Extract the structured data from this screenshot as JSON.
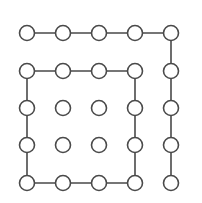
{
  "diagram": {
    "type": "node-grid",
    "background": "#ffffff",
    "stroke_color": "#4a4a4a",
    "node_fill": "#ffffff",
    "node_radius": 7.5,
    "stroke_width": 1.6,
    "columns_x": [
      27,
      63,
      99,
      135,
      171
    ],
    "rows_y": [
      33,
      71,
      108,
      145,
      183
    ],
    "nodes": [
      {
        "id": "r1c1",
        "row": 0,
        "col": 0
      },
      {
        "id": "r1c2",
        "row": 0,
        "col": 1
      },
      {
        "id": "r1c3",
        "row": 0,
        "col": 2
      },
      {
        "id": "r1c4",
        "row": 0,
        "col": 3
      },
      {
        "id": "r1c5",
        "row": 0,
        "col": 4
      },
      {
        "id": "r2c1",
        "row": 1,
        "col": 0
      },
      {
        "id": "r2c2",
        "row": 1,
        "col": 1
      },
      {
        "id": "r2c3",
        "row": 1,
        "col": 2
      },
      {
        "id": "r2c4",
        "row": 1,
        "col": 3
      },
      {
        "id": "r2c5",
        "row": 1,
        "col": 4
      },
      {
        "id": "r3c1",
        "row": 2,
        "col": 0
      },
      {
        "id": "r3c2",
        "row": 2,
        "col": 1
      },
      {
        "id": "r3c3",
        "row": 2,
        "col": 2
      },
      {
        "id": "r3c4",
        "row": 2,
        "col": 3
      },
      {
        "id": "r3c5",
        "row": 2,
        "col": 4
      },
      {
        "id": "r4c1",
        "row": 3,
        "col": 0
      },
      {
        "id": "r4c2",
        "row": 3,
        "col": 1
      },
      {
        "id": "r4c3",
        "row": 3,
        "col": 2
      },
      {
        "id": "r4c4",
        "row": 3,
        "col": 3
      },
      {
        "id": "r4c5",
        "row": 3,
        "col": 4
      },
      {
        "id": "r5c1",
        "row": 4,
        "col": 0
      },
      {
        "id": "r5c2",
        "row": 4,
        "col": 1
      },
      {
        "id": "r5c3",
        "row": 4,
        "col": 2
      },
      {
        "id": "r5c4",
        "row": 4,
        "col": 3
      },
      {
        "id": "r5c5",
        "row": 4,
        "col": 4
      }
    ],
    "paths": [
      {
        "name": "outer-hook-path",
        "points": [
          [
            0,
            0
          ],
          [
            0,
            1
          ],
          [
            0,
            2
          ],
          [
            0,
            3
          ],
          [
            0,
            4
          ],
          [
            1,
            4
          ],
          [
            2,
            4
          ],
          [
            3,
            4
          ],
          [
            4,
            4
          ]
        ]
      },
      {
        "name": "inner-square-loop",
        "points": [
          [
            1,
            0
          ],
          [
            1,
            1
          ],
          [
            1,
            2
          ],
          [
            1,
            3
          ],
          [
            2,
            3
          ],
          [
            3,
            3
          ],
          [
            4,
            3
          ],
          [
            4,
            2
          ],
          [
            4,
            1
          ],
          [
            4,
            0
          ],
          [
            3,
            0
          ],
          [
            2,
            0
          ],
          [
            1,
            0
          ]
        ]
      }
    ],
    "isolated_nodes": [
      "r3c2",
      "r3c3",
      "r4c2",
      "r4c3"
    ]
  }
}
